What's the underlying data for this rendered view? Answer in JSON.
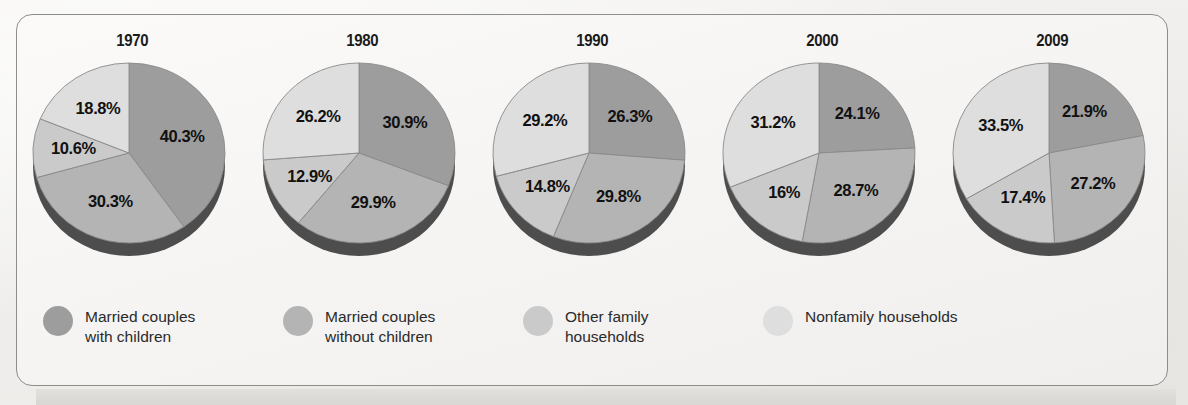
{
  "figure": {
    "categories": [
      {
        "key": "married_with_children",
        "label": "Married couples\nwith children",
        "color": "#9d9d9d"
      },
      {
        "key": "married_without_children",
        "label": "Married couples\nwithout children",
        "color": "#b4b4b4"
      },
      {
        "key": "other_family",
        "label": "Other family\nhouseholds",
        "color": "#cacaca"
      },
      {
        "key": "nonfamily",
        "label": "Nonfamily households",
        "color": "#dedede"
      }
    ],
    "depth_color": "#4d4d4d",
    "slice_border_color": "#8a8a8a"
  },
  "chart_data": {
    "type": "pie",
    "title": "",
    "legend_position": "bottom",
    "categories": [
      "Married couples with children",
      "Married couples without children",
      "Other family households",
      "Nonfamily households"
    ],
    "charts": [
      {
        "year": "1970",
        "labels": [
          "40.3%",
          "30.3%",
          "10.6%",
          "18.8%"
        ],
        "values": [
          40.3,
          30.3,
          10.6,
          18.8
        ]
      },
      {
        "year": "1980",
        "labels": [
          "30.9%",
          "29.9%",
          "12.9%",
          "26.2%"
        ],
        "values": [
          30.9,
          29.9,
          12.9,
          26.2
        ]
      },
      {
        "year": "1990",
        "labels": [
          "26.3%",
          "29.8%",
          "14.8%",
          "29.2%"
        ],
        "values": [
          26.3,
          29.8,
          14.8,
          29.2
        ]
      },
      {
        "year": "2000",
        "labels": [
          "24.1%",
          "28.7%",
          "16%",
          "31.2%"
        ],
        "values": [
          24.1,
          28.7,
          16.0,
          31.2
        ]
      },
      {
        "year": "2009",
        "labels": [
          "21.9%",
          "27.2%",
          "17.4%",
          "33.5%"
        ],
        "values": [
          21.9,
          27.2,
          17.4,
          33.5
        ]
      }
    ]
  }
}
